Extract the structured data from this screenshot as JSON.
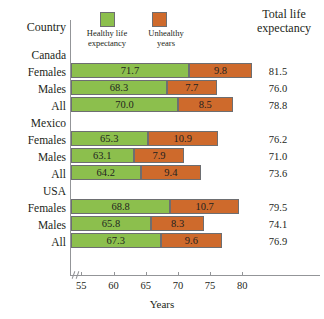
{
  "header": {
    "country_label": "Country",
    "total_label": "Total life expectancy"
  },
  "legend": {
    "items": [
      {
        "label": "Healthy life expectancy",
        "color": "#8cbf4d",
        "key": "healthy"
      },
      {
        "label": "Unhealthy years",
        "color": "#ce6a2c",
        "key": "unhealthy"
      }
    ]
  },
  "axis": {
    "title": "Years",
    "ticks": [
      "55",
      "60",
      "65",
      "70",
      "75",
      "80"
    ],
    "has_break": true
  },
  "chart_data": {
    "type": "bar",
    "orientation": "horizontal",
    "stacked": true,
    "title": "",
    "xlabel": "Years",
    "ylabel": "Country",
    "xlim": [
      53,
      84
    ],
    "grid": false,
    "legend_position": "top",
    "series": [
      {
        "name": "Healthy life expectancy",
        "color": "#8cbf4d",
        "values": [
          71.7,
          68.3,
          70.0,
          65.3,
          63.1,
          64.2,
          68.8,
          65.8,
          67.3
        ]
      },
      {
        "name": "Unhealthy years",
        "color": "#ce6a2c",
        "values": [
          9.8,
          7.7,
          8.5,
          10.9,
          7.9,
          9.4,
          10.7,
          8.3,
          9.6
        ]
      }
    ],
    "categories": [
      "Canada Females",
      "Canada Males",
      "Canada All",
      "Mexico Females",
      "Mexico Males",
      "Mexico All",
      "USA Females",
      "USA Males",
      "USA All"
    ],
    "totals": [
      81.5,
      76.0,
      78.8,
      76.2,
      71.0,
      73.6,
      79.5,
      74.1,
      76.9
    ],
    "groups": [
      {
        "name": "Canada",
        "rows": [
          {
            "label": "Females",
            "healthy": "71.7",
            "unhealthy": "9.8",
            "total": "81.5"
          },
          {
            "label": "Males",
            "healthy": "68.3",
            "unhealthy": "7.7",
            "total": "76.0"
          },
          {
            "label": "All",
            "healthy": "70.0",
            "unhealthy": "8.5",
            "total": "78.8"
          }
        ]
      },
      {
        "name": "Mexico",
        "rows": [
          {
            "label": "Females",
            "healthy": "65.3",
            "unhealthy": "10.9",
            "total": "76.2"
          },
          {
            "label": "Males",
            "healthy": "63.1",
            "unhealthy": "7.9",
            "total": "71.0"
          },
          {
            "label": "All",
            "healthy": "64.2",
            "unhealthy": "9.4",
            "total": "73.6"
          }
        ]
      },
      {
        "name": "USA",
        "rows": [
          {
            "label": "Females",
            "healthy": "68.8",
            "unhealthy": "10.7",
            "total": "79.5"
          },
          {
            "label": "Males",
            "healthy": "65.8",
            "unhealthy": "8.3",
            "total": "74.1"
          },
          {
            "label": "All",
            "healthy": "67.3",
            "unhealthy": "9.6",
            "total": "76.9"
          }
        ]
      }
    ]
  }
}
